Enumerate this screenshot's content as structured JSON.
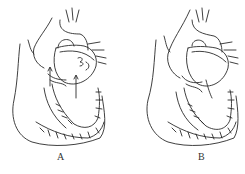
{
  "figure": {
    "panels": [
      {
        "id": "A",
        "label": "A",
        "description": "heart-cross-section-with-arrows"
      },
      {
        "id": "B",
        "label": "B",
        "description": "heart-cross-section"
      }
    ],
    "colors": {
      "line": "#2a2a2a",
      "background": "#ffffff"
    }
  }
}
